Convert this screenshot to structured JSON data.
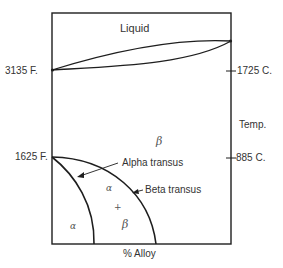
{
  "diagram": {
    "type": "phase-diagram",
    "regions": {
      "liquid": "Liquid",
      "beta_top": "β",
      "alpha_beta_alpha": "α",
      "alpha_beta_plus": "+",
      "alpha_beta_beta": "β",
      "alpha": "α"
    },
    "left_axis": {
      "high_temp": "3135 F.",
      "low_temp": "1625 F."
    },
    "right_axis": {
      "high_temp": "1725 C.",
      "title": "Temp.",
      "low_temp": "885 C."
    },
    "x_axis": {
      "title": "% Alloy"
    },
    "curve_labels": {
      "alpha_transus": "Alpha transus",
      "beta_transus": "Beta transus"
    },
    "colors": {
      "line": "#1e1e1e",
      "text": "#333333",
      "background": "#ffffff"
    }
  }
}
